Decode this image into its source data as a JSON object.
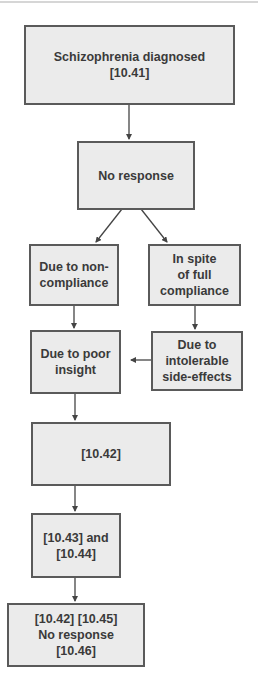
{
  "diagram": {
    "type": "flowchart",
    "colors": {
      "box_fill": "#ebebeb",
      "box_border": "#5a5a5a",
      "text": "#3a3a3a",
      "arrow": "#444444"
    },
    "nodes": {
      "schizophrenia_diagnosed": {
        "label": "Schizophrenia diagnosed\n[10.41]"
      },
      "no_response": {
        "label": "No response"
      },
      "non_compliance": {
        "label": "Due to non-\ncompliance"
      },
      "full_compliance": {
        "label": "In spite\nof full\ncompliance"
      },
      "poor_insight": {
        "label": "Due to poor\ninsight"
      },
      "side_effects": {
        "label": "Due to\nintolerable\nside-effects"
      },
      "ref_10_42": {
        "label": "[10.42]"
      },
      "ref_10_43_44": {
        "label": "[10.43] and\n[10.44]"
      },
      "final": {
        "label": "[10.42] [10.45]\nNo response\n[10.46]"
      }
    },
    "edges": [
      {
        "from": "schizophrenia_diagnosed",
        "to": "no_response"
      },
      {
        "from": "no_response",
        "to": "non_compliance"
      },
      {
        "from": "no_response",
        "to": "full_compliance"
      },
      {
        "from": "non_compliance",
        "to": "poor_insight"
      },
      {
        "from": "full_compliance",
        "to": "side_effects"
      },
      {
        "from": "side_effects",
        "to": "poor_insight"
      },
      {
        "from": "poor_insight",
        "to": "ref_10_42"
      },
      {
        "from": "ref_10_42",
        "to": "ref_10_43_44"
      },
      {
        "from": "ref_10_43_44",
        "to": "final"
      }
    ]
  }
}
